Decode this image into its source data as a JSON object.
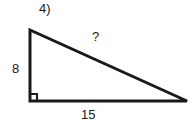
{
  "figure": {
    "problem_number": "4)",
    "type": "right-triangle",
    "stroke_color": "#1a1a1a",
    "background_color": "#ffffff",
    "labels": {
      "vertical_leg": "8",
      "horizontal_leg": "15",
      "hypotenuse": "?"
    },
    "geometry": {
      "top_vertex_x": 30,
      "top_vertex_y": 30,
      "right_angle_vertex_x": 30,
      "right_angle_vertex_y": 101,
      "bottom_right_vertex_x": 187,
      "bottom_right_vertex_y": 101,
      "stroke_width": 3,
      "right_angle_marker_size": 7
    }
  }
}
